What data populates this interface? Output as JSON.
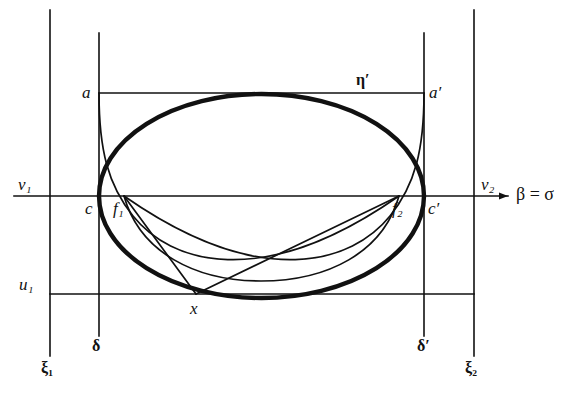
{
  "figure": {
    "type": "geometric-diagram",
    "background_color": "#ffffff",
    "stroke_color": "#111111"
  },
  "labels": {
    "xi_1": "ξ₁",
    "xi_2": "ξ₂",
    "delta": "δ",
    "delta_prime": "δ′",
    "eta_prime": "η′",
    "v_1": "v₁",
    "v_2": "v₂",
    "u_1": "u₁",
    "a": "a",
    "a_prime": "a′",
    "c": "c",
    "c_prime": "c′",
    "f_1": "f₁",
    "f_2": "f₂",
    "x": "x",
    "axis": "β = σ"
  },
  "geometry": {
    "vertical_lines": [
      {
        "name": "xi-1-line",
        "x": 50,
        "y_top": 10,
        "y_bottom": 356
      },
      {
        "name": "delta-line",
        "x": 99,
        "y_top": 33,
        "y_bottom": 336
      },
      {
        "name": "delta-prime-line",
        "x": 424,
        "y_top": 33,
        "y_bottom": 336
      },
      {
        "name": "xi-2-line",
        "x": 474,
        "y_top": 10,
        "y_bottom": 356
      }
    ],
    "horizontal_lines": [
      {
        "name": "eta-prime-line",
        "y": 93,
        "x_start": 99,
        "x_end": 424
      },
      {
        "name": "beta-sigma-axis",
        "y": 196,
        "x_start": 14,
        "x_end": 508
      },
      {
        "name": "u-1-line",
        "y": 294,
        "x_start": 50,
        "x_end": 474
      }
    ],
    "ellipse": {
      "cx": 261.5,
      "cy": 196,
      "rx": 162.5,
      "ry": 102,
      "stroke_width": 4.2
    },
    "points": {
      "a": {
        "x": 99,
        "y": 93
      },
      "a_prime": {
        "x": 424,
        "y": 93
      },
      "c": {
        "x": 99,
        "y": 196
      },
      "c_prime": {
        "x": 424,
        "y": 196
      },
      "f_1": {
        "x": 124,
        "y": 196
      },
      "f_2": {
        "x": 399,
        "y": 196
      },
      "x": {
        "x": 196,
        "y": 294
      }
    }
  }
}
